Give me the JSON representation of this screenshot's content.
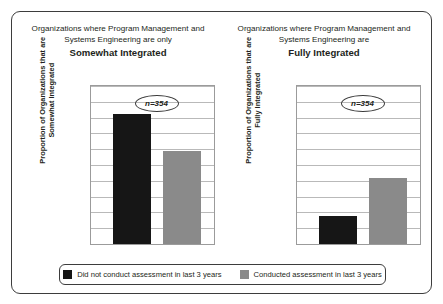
{
  "figure": {
    "background": "#ffffff",
    "border_color": "#3d3d3d"
  },
  "colors": {
    "dark": "#161616",
    "light": "#8a8a8a",
    "grid": "#b9b9b9",
    "axis": "#9b9b9b",
    "text": "#231f20"
  },
  "panels": [
    {
      "title_line1": "Organizations where Program Management",
      "title_line2": "and Systems Engineering are only",
      "title_emphasis": "Somewhat Integrated",
      "axis_label_line1": "Proportion of Organizations that are",
      "axis_label_line2": "Somewhat Integrated",
      "annotation": "n=354",
      "bars": [
        {
          "series": "Did not conduct assessment in last 3 years",
          "value": 0.82
        },
        {
          "series": "Conducted assessment in last 3 years",
          "value": 0.59
        }
      ]
    },
    {
      "title_line1": "Organizations where Program Management",
      "title_line2": "and Systems Engineering are",
      "title_emphasis": "Fully Integrated",
      "axis_label_line1": "Proportion of Organizations that are",
      "axis_label_line2": "Fully Integrated",
      "annotation": "n=354",
      "bars": [
        {
          "series": "Did not conduct assessment in last 3 years",
          "value": 0.18
        },
        {
          "series": "Conducted assessment in last 3 years",
          "value": 0.42
        }
      ]
    }
  ],
  "axis": {
    "ticks": [
      "1",
      "0.9",
      "0.8",
      "0.7",
      "0.6",
      "0.5",
      "0.4",
      "0.3",
      "0.2",
      "0.1",
      "0"
    ],
    "min": 0,
    "max": 1
  },
  "legend": {
    "items": [
      {
        "label": "Did not conduct assessment in last 3 years",
        "color": "#161616"
      },
      {
        "label": "Conducted assessment in last 3 years",
        "color": "#8a8a8a"
      }
    ]
  },
  "chart_data": [
    {
      "type": "bar",
      "title": "Organizations where Program Management and Systems Engineering are only Somewhat Integrated",
      "categories": [
        "Did not conduct assessment in last 3 years",
        "Conducted assessment in last 3 years"
      ],
      "values": [
        0.82,
        0.59
      ],
      "xlabel": "",
      "ylabel": "Proportion of Organizations that are Somewhat Integrated",
      "ylim": [
        0,
        1
      ],
      "yticks": [
        0,
        0.1,
        0.2,
        0.3,
        0.4,
        0.5,
        0.6,
        0.7,
        0.8,
        0.9,
        1
      ],
      "grid": true,
      "legend_position": "bottom",
      "annotations": [
        "n=354"
      ]
    },
    {
      "type": "bar",
      "title": "Organizations where Program Management and Systems Engineering are Fully Integrated",
      "categories": [
        "Did not conduct assessment in last 3 years",
        "Conducted assessment in last 3 years"
      ],
      "values": [
        0.18,
        0.42
      ],
      "xlabel": "",
      "ylabel": "Proportion of Organizations that are Fully Integrated",
      "ylim": [
        0,
        1
      ],
      "yticks": [
        0,
        0.1,
        0.2,
        0.3,
        0.4,
        0.5,
        0.6,
        0.7,
        0.8,
        0.9,
        1
      ],
      "grid": true,
      "legend_position": "bottom",
      "annotations": [
        "n=354"
      ]
    }
  ]
}
